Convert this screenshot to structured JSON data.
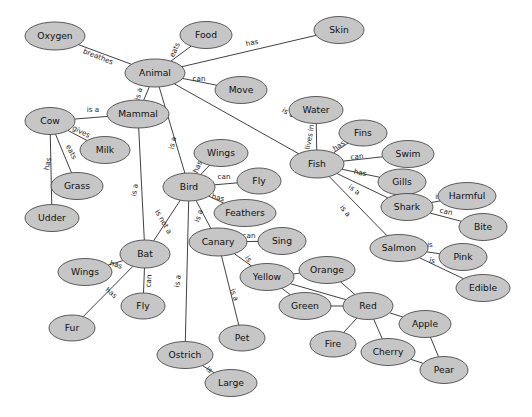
{
  "diagram": {
    "node_fill": "#c6c6c6",
    "node_stroke": "#4a4a4a",
    "edge_stroke": "#2b2b2b",
    "background": "#ffffff",
    "nodes": [
      {
        "id": "oxygen",
        "label": "Oxygen",
        "x": 55,
        "y": 36,
        "rx": 30,
        "ry": 14
      },
      {
        "id": "food",
        "label": "Food",
        "x": 206,
        "y": 35,
        "rx": 26,
        "ry": 13.5
      },
      {
        "id": "skin",
        "label": "Skin",
        "x": 339,
        "y": 30,
        "rx": 25,
        "ry": 13.5
      },
      {
        "id": "animal",
        "label": "Animal",
        "x": 155,
        "y": 73,
        "rx": 30,
        "ry": 14
      },
      {
        "id": "move",
        "label": "Move",
        "x": 241,
        "y": 90,
        "rx": 26,
        "ry": 13.5
      },
      {
        "id": "water",
        "label": "Water",
        "x": 316,
        "y": 110,
        "rx": 27,
        "ry": 13.5
      },
      {
        "id": "mammal",
        "label": "Mammal",
        "x": 138,
        "y": 114,
        "rx": 31,
        "ry": 14
      },
      {
        "id": "cow",
        "label": "Cow",
        "x": 50,
        "y": 121,
        "rx": 25,
        "ry": 13.5
      },
      {
        "id": "fins",
        "label": "Fins",
        "x": 363,
        "y": 133,
        "rx": 24,
        "ry": 13
      },
      {
        "id": "milk",
        "label": "Milk",
        "x": 105,
        "y": 150,
        "rx": 25,
        "ry": 13.5
      },
      {
        "id": "swim",
        "label": "Swim",
        "x": 408,
        "y": 154,
        "rx": 26,
        "ry": 13.5
      },
      {
        "id": "wings_b",
        "label": "Wings",
        "x": 221,
        "y": 153,
        "rx": 27,
        "ry": 13.5
      },
      {
        "id": "fish",
        "label": "Fish",
        "x": 317,
        "y": 164,
        "rx": 27,
        "ry": 14
      },
      {
        "id": "fly_b",
        "label": "Fly",
        "x": 259,
        "y": 181,
        "rx": 22,
        "ry": 13
      },
      {
        "id": "gills",
        "label": "Gills",
        "x": 402,
        "y": 182,
        "rx": 24,
        "ry": 13
      },
      {
        "id": "grass",
        "label": "Grass",
        "x": 77,
        "y": 186,
        "rx": 26,
        "ry": 13.5
      },
      {
        "id": "bird",
        "label": "Bird",
        "x": 189,
        "y": 187,
        "rx": 26,
        "ry": 14
      },
      {
        "id": "harmful",
        "label": "Harmful",
        "x": 467,
        "y": 196,
        "rx": 29,
        "ry": 13.5
      },
      {
        "id": "shark",
        "label": "Shark",
        "x": 407,
        "y": 207,
        "rx": 26,
        "ry": 13.5
      },
      {
        "id": "feathers",
        "label": "Feathers",
        "x": 245,
        "y": 213,
        "rx": 31,
        "ry": 13.5
      },
      {
        "id": "udder",
        "label": "Udder",
        "x": 52,
        "y": 218,
        "rx": 27,
        "ry": 13.5
      },
      {
        "id": "bite",
        "label": "Bite",
        "x": 483,
        "y": 227,
        "rx": 24,
        "ry": 13.5
      },
      {
        "id": "canary",
        "label": "Canary",
        "x": 218,
        "y": 242,
        "rx": 29,
        "ry": 14
      },
      {
        "id": "sing",
        "label": "Sing",
        "x": 282,
        "y": 241,
        "rx": 24,
        "ry": 13.5
      },
      {
        "id": "salmon",
        "label": "Salmon",
        "x": 399,
        "y": 248,
        "rx": 29,
        "ry": 13.5
      },
      {
        "id": "bat",
        "label": "Bat",
        "x": 145,
        "y": 254,
        "rx": 25,
        "ry": 14
      },
      {
        "id": "pink",
        "label": "Pink",
        "x": 463,
        "y": 257,
        "rx": 24,
        "ry": 13.5
      },
      {
        "id": "orange",
        "label": "Orange",
        "x": 327,
        "y": 270,
        "rx": 28,
        "ry": 13.5
      },
      {
        "id": "wings_bt",
        "label": "Wings",
        "x": 85,
        "y": 272,
        "rx": 27,
        "ry": 13.5
      },
      {
        "id": "yellow",
        "label": "Yellow",
        "x": 267,
        "y": 277,
        "rx": 27,
        "ry": 13.5
      },
      {
        "id": "edible",
        "label": "Edible",
        "x": 483,
        "y": 288,
        "rx": 27,
        "ry": 13.5
      },
      {
        "id": "green",
        "label": "Green",
        "x": 305,
        "y": 306,
        "rx": 26,
        "ry": 13.5
      },
      {
        "id": "red",
        "label": "Red",
        "x": 368,
        "y": 306,
        "rx": 25,
        "ry": 13.5
      },
      {
        "id": "fly_bt",
        "label": "Fly",
        "x": 143,
        "y": 306,
        "rx": 22,
        "ry": 13
      },
      {
        "id": "apple",
        "label": "Apple",
        "x": 425,
        "y": 324,
        "rx": 26,
        "ry": 13.5
      },
      {
        "id": "fur",
        "label": "Fur",
        "x": 72,
        "y": 328,
        "rx": 23,
        "ry": 13
      },
      {
        "id": "fire",
        "label": "Fire",
        "x": 333,
        "y": 344,
        "rx": 23,
        "ry": 13
      },
      {
        "id": "pet",
        "label": "Pet",
        "x": 242,
        "y": 338,
        "rx": 23,
        "ry": 13
      },
      {
        "id": "cherry",
        "label": "Cherry",
        "x": 388,
        "y": 352,
        "rx": 27,
        "ry": 13.5
      },
      {
        "id": "ostrich",
        "label": "Ostrich",
        "x": 185,
        "y": 355,
        "rx": 28,
        "ry": 13.5
      },
      {
        "id": "pear",
        "label": "Pear",
        "x": 444,
        "y": 370,
        "rx": 24,
        "ry": 13.5
      },
      {
        "id": "large",
        "label": "Large",
        "x": 231,
        "y": 383,
        "rx": 26,
        "ry": 13.5
      }
    ],
    "edges": [
      {
        "from": "animal",
        "to": "oxygen",
        "label": "breathes",
        "lx": 98,
        "ly": 57,
        "rot": 22
      },
      {
        "from": "animal",
        "to": "food",
        "label": "eats",
        "lx": 175,
        "ly": 50,
        "rot": -66
      },
      {
        "from": "animal",
        "to": "skin",
        "label": "has",
        "lx": 252,
        "ly": 43,
        "rot": -12
      },
      {
        "from": "animal",
        "to": "move",
        "label": "can",
        "lx": 199,
        "ly": 79,
        "rot": 0
      },
      {
        "from": "animal",
        "to": "mammal",
        "label": "is a",
        "lx": 139,
        "ly": 94,
        "rot": -76
      },
      {
        "from": "animal",
        "to": "fish",
        "label": "is a",
        "lx": 288,
        "ly": 113,
        "rot": 28
      },
      {
        "from": "animal",
        "to": "bird",
        "label": "is a",
        "lx": 173,
        "ly": 143,
        "rot": -78
      },
      {
        "from": "cow",
        "to": "mammal",
        "label": "is a",
        "lx": 93,
        "ly": 110,
        "rot": 0
      },
      {
        "from": "cow",
        "to": "milk",
        "label": "gives",
        "lx": 81,
        "ly": 132,
        "rot": 27
      },
      {
        "from": "cow",
        "to": "grass",
        "label": "eats",
        "lx": 71,
        "ly": 152,
        "rot": 63
      },
      {
        "from": "cow",
        "to": "udder",
        "label": "has",
        "lx": 48,
        "ly": 164,
        "rot": -80
      },
      {
        "from": "mammal",
        "to": "bat",
        "label": "is a",
        "lx": 135,
        "ly": 190,
        "rot": -82
      },
      {
        "from": "fish",
        "to": "water",
        "label": "lives in",
        "lx": 310,
        "ly": 137,
        "rot": -80
      },
      {
        "from": "fish",
        "to": "fins",
        "label": "has",
        "lx": 339,
        "ly": 146,
        "rot": -34
      },
      {
        "from": "fish",
        "to": "swim",
        "label": "can",
        "lx": 357,
        "ly": 157,
        "rot": -8
      },
      {
        "from": "fish",
        "to": "gills",
        "label": "has",
        "lx": 360,
        "ly": 173,
        "rot": 10
      },
      {
        "from": "fish",
        "to": "shark",
        "label": "is a",
        "lx": 354,
        "ly": 190,
        "rot": 35
      },
      {
        "from": "fish",
        "to": "salmon",
        "label": "is a",
        "lx": 345,
        "ly": 211,
        "rot": 51
      },
      {
        "from": "shark",
        "to": "harmful",
        "label": "is",
        "lx": 438,
        "ly": 197,
        "rot": 0
      },
      {
        "from": "shark",
        "to": "bite",
        "label": "can",
        "lx": 446,
        "ly": 212,
        "rot": 12
      },
      {
        "from": "salmon",
        "to": "pink",
        "label": "is",
        "lx": 430,
        "ly": 245,
        "rot": 0
      },
      {
        "from": "salmon",
        "to": "edible",
        "label": "is",
        "lx": 432,
        "ly": 261,
        "rot": 13
      },
      {
        "from": "bird",
        "to": "wings_b",
        "label": "has",
        "lx": 198,
        "ly": 167,
        "rot": -66
      },
      {
        "from": "bird",
        "to": "fly_b",
        "label": "can",
        "lx": 224,
        "ly": 177,
        "rot": 0
      },
      {
        "from": "bird",
        "to": "feathers",
        "label": "has",
        "lx": 218,
        "ly": 198,
        "rot": 15
      },
      {
        "from": "bird",
        "to": "bat",
        "label": "is not a",
        "lx": 163,
        "ly": 222,
        "rot": 60
      },
      {
        "from": "bird",
        "to": "canary",
        "label": "is a",
        "lx": 199,
        "ly": 216,
        "rot": -73
      },
      {
        "from": "bird",
        "to": "ostrich",
        "label": "is a",
        "lx": 178,
        "ly": 281,
        "rot": -84
      },
      {
        "from": "bat",
        "to": "wings_bt",
        "label": "has",
        "lx": 116,
        "ly": 265,
        "rot": 18
      },
      {
        "from": "bat",
        "to": "fly_bt",
        "label": "can",
        "lx": 149,
        "ly": 281,
        "rot": -85
      },
      {
        "from": "bat",
        "to": "fur",
        "label": "has",
        "lx": 111,
        "ly": 293,
        "rot": 40
      },
      {
        "from": "canary",
        "to": "sing",
        "label": "can",
        "lx": 249,
        "ly": 236,
        "rot": 0
      },
      {
        "from": "canary",
        "to": "yellow",
        "label": "is",
        "lx": 248,
        "ly": 259,
        "rot": 55
      },
      {
        "from": "canary",
        "to": "pet",
        "label": "is a",
        "lx": 234,
        "ly": 295,
        "rot": 70
      },
      {
        "from": "ostrich",
        "to": "large",
        "label": "is",
        "lx": 209,
        "ly": 370,
        "rot": 38
      },
      {
        "from": "yellow",
        "to": "orange",
        "label": "",
        "lx": 0,
        "ly": 0,
        "rot": 0
      },
      {
        "from": "yellow",
        "to": "green",
        "label": "",
        "lx": 0,
        "ly": 0,
        "rot": 0
      },
      {
        "from": "yellow",
        "to": "red",
        "label": "",
        "lx": 0,
        "ly": 0,
        "rot": 0
      },
      {
        "from": "orange",
        "to": "red",
        "label": "",
        "lx": 0,
        "ly": 0,
        "rot": 0
      },
      {
        "from": "green",
        "to": "red",
        "label": "",
        "lx": 0,
        "ly": 0,
        "rot": 0
      },
      {
        "from": "red",
        "to": "fire",
        "label": "",
        "lx": 0,
        "ly": 0,
        "rot": 0
      },
      {
        "from": "red",
        "to": "cherry",
        "label": "",
        "lx": 0,
        "ly": 0,
        "rot": 0
      },
      {
        "from": "red",
        "to": "apple",
        "label": "",
        "lx": 0,
        "ly": 0,
        "rot": 0
      },
      {
        "from": "apple",
        "to": "pear",
        "label": "",
        "lx": 0,
        "ly": 0,
        "rot": 0
      },
      {
        "from": "cherry",
        "to": "pear",
        "label": "",
        "lx": 0,
        "ly": 0,
        "rot": 0
      }
    ]
  }
}
